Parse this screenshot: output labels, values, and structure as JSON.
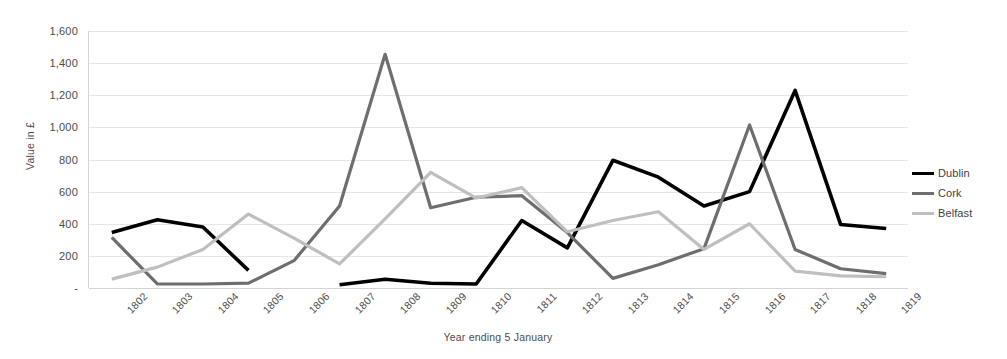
{
  "chart_data": {
    "type": "line",
    "title": "",
    "xlabel": "Year ending 5 January",
    "ylabel": "Value in £",
    "ylim": [
      0,
      1600
    ],
    "ytick_values": [
      0,
      200,
      400,
      600,
      800,
      1000,
      1200,
      1400,
      1600
    ],
    "ytick_labels": [
      "-",
      "200",
      "400",
      "600",
      "800",
      "1,000",
      "1,200",
      "1,400",
      "1,600"
    ],
    "grid": true,
    "legend_position": "right",
    "categories": [
      "1802",
      "1803",
      "1804",
      "1805",
      "1806",
      "1807",
      "1808",
      "1809",
      "1810",
      "1811",
      "1812",
      "1813",
      "1814",
      "1815",
      "1816",
      "1817",
      "1818",
      "1819"
    ],
    "series": [
      {
        "name": "Dublin",
        "color": "#000000",
        "values": [
          345,
          425,
          380,
          110,
          null,
          20,
          55,
          30,
          25,
          420,
          250,
          795,
          690,
          510,
          600,
          1230,
          395,
          370
        ]
      },
      {
        "name": "Cork",
        "color": "#6e6e6e",
        "values": [
          315,
          25,
          25,
          30,
          170,
          510,
          1455,
          500,
          565,
          575,
          345,
          60,
          145,
          245,
          1015,
          240,
          120,
          90
        ]
      },
      {
        "name": "Belfast",
        "color": "#bfbfbf",
        "values": [
          55,
          130,
          240,
          460,
          310,
          150,
          430,
          720,
          560,
          625,
          350,
          420,
          475,
          240,
          400,
          105,
          75,
          70
        ]
      }
    ]
  },
  "legend": {
    "items": [
      {
        "label": "Dublin",
        "color": "#000000"
      },
      {
        "label": "Cork",
        "color": "#6e6e6e"
      },
      {
        "label": "Belfast",
        "color": "#bfbfbf"
      }
    ]
  }
}
